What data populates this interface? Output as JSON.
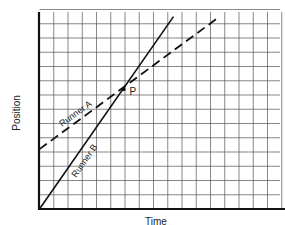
{
  "chart_data": {
    "type": "line",
    "title": "",
    "xlabel": "Time",
    "ylabel": "Position",
    "grid": true,
    "xlim": [
      0,
      17
    ],
    "ylim": [
      0,
      14
    ],
    "ticks_labeled": false,
    "series": [
      {
        "name": "Runner A",
        "style": "dashed",
        "color": "#222222",
        "points": [
          [
            0,
            4.2
          ],
          [
            12.5,
            13.4
          ]
        ]
      },
      {
        "name": "Runner B",
        "style": "solid",
        "color": "#222222",
        "points": [
          [
            0,
            0
          ],
          [
            9.4,
            13.5
          ]
        ]
      }
    ],
    "annotations": [
      {
        "text": "P",
        "x": 5.9,
        "y": 8.4,
        "description": "intersection point of Runner A and Runner B"
      }
    ]
  },
  "labels": {
    "x_axis": "Time",
    "y_axis": "Position",
    "runner_a": "Runner A",
    "runner_b": "Runner B",
    "point": "P"
  }
}
